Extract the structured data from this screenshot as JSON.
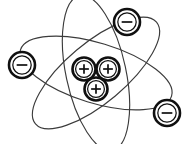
{
  "figure": {
    "background_color": "#ffffff",
    "width": 191,
    "height": 144,
    "line_color": "#3b3b3b",
    "particle_outline_color": "#101010"
  },
  "nucleus": {
    "label": "nucleus",
    "particle_count": 3,
    "protons": [
      {
        "label": "proton",
        "charge_symbol": "+",
        "cx": 84,
        "cy": 69,
        "r_outer": 11.5,
        "r_inner": 8.4
      },
      {
        "label": "proton",
        "charge_symbol": "+",
        "cx": 108,
        "cy": 69,
        "r_outer": 11.5,
        "r_inner": 8.4
      },
      {
        "label": "proton",
        "charge_symbol": "+",
        "cx": 96,
        "cy": 89,
        "r_outer": 11.5,
        "r_inner": 8.4
      }
    ]
  },
  "electrons": [
    {
      "label": "electron-top-right",
      "charge_symbol": "-",
      "cx": 127,
      "cy": 22,
      "r_outer": 13,
      "r_inner": 9.2
    },
    {
      "label": "electron-left",
      "charge_symbol": "-",
      "cx": 22,
      "cy": 65,
      "r_outer": 13,
      "r_inner": 9.2
    },
    {
      "label": "electron-bottom-right",
      "charge_symbol": "-",
      "cx": 167,
      "cy": 113,
      "r_outer": 13,
      "r_inner": 9.2
    }
  ],
  "orbits": [
    {
      "label": "orbit-1",
      "cx": 96,
      "cy": 73,
      "rx": 79,
      "ry": 30,
      "rotation_deg": 17
    },
    {
      "label": "orbit-2",
      "cx": 96,
      "cy": 73,
      "rx": 79,
      "ry": 30,
      "rotation_deg": 78
    },
    {
      "label": "orbit-3",
      "cx": 96,
      "cy": 73,
      "rx": 79,
      "ry": 30,
      "rotation_deg": 140
    }
  ]
}
